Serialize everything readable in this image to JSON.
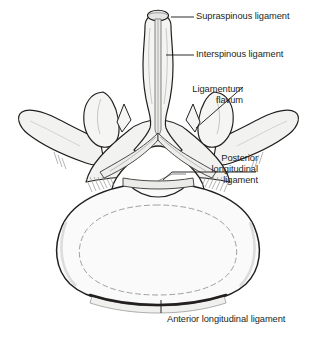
{
  "figure": {
    "name": "lumbar-vertebra-superior-view-ligaments",
    "colors": {
      "background": "#ffffff",
      "outline": "#231f20",
      "bone_fill": "#f2f2f0",
      "body_fill": "#fafafa",
      "shading": "#b8b8b6",
      "ligament_dark": "#3a3a3a",
      "leader_line": "#231f20",
      "text": "#231f20"
    }
  },
  "labels": [
    {
      "id": "supraspinous",
      "text": "Supraspinous ligament",
      "lines": [
        "Supraspinous ligament"
      ],
      "align": "left",
      "x": 196,
      "y": 11,
      "leader": {
        "type": "line",
        "x1": 171,
        "y1": 17,
        "x2": 194,
        "y2": 17
      }
    },
    {
      "id": "interspinous",
      "text": "Interspinous ligament",
      "lines": [
        "Interspinous ligament"
      ],
      "align": "left",
      "x": 196,
      "y": 49,
      "leader": {
        "type": "line",
        "x1": 166,
        "y1": 55,
        "x2": 194,
        "y2": 55
      }
    },
    {
      "id": "ligamentum-flavum",
      "text": "Ligamentum flavum",
      "lines": [
        "Ligamentum",
        "flavum"
      ],
      "align": "right",
      "x": 243,
      "y": 84,
      "leader": {
        "type": "line",
        "x1": 196,
        "y1": 128,
        "x2": 243,
        "y2": 87
      }
    },
    {
      "id": "posterior-longitudinal",
      "text": "Posterior longitudinal ligament",
      "lines": [
        "Posterior",
        "longitudinal",
        "ligament"
      ],
      "align": "right",
      "x": 258,
      "y": 153,
      "leader": {
        "type": "hook",
        "x1": 163,
        "y1": 180,
        "x2": 172,
        "y2": 172,
        "x3": 256,
        "y3": 172
      }
    },
    {
      "id": "anterior-longitudinal",
      "text": "Anterior longitudinal ligament",
      "lines": [
        "Anterior longitudinal ligament"
      ],
      "align": "left",
      "x": 167,
      "y": 314,
      "leader": {
        "type": "line",
        "x1": 161,
        "y1": 300,
        "x2": 161,
        "y2": 313
      }
    }
  ]
}
